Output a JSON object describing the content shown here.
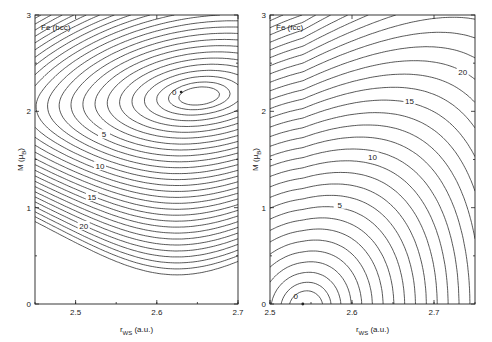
{
  "chart_data": [
    {
      "type": "contour",
      "title": "Fe (bcc)",
      "xlabel": "r_WS (a.u.)",
      "ylabel": "M (μ_B)",
      "xlim": [
        2.45,
        2.7
      ],
      "ylim": [
        0,
        3
      ],
      "xticks": [
        {
          "value": 2.5,
          "label": "2.5"
        },
        {
          "value": 2.6,
          "label": "2.6"
        },
        {
          "value": 2.7,
          "label": "2.7"
        }
      ],
      "yticks": [
        {
          "value": 0,
          "label": "0"
        },
        {
          "value": 1,
          "label": "1"
        },
        {
          "value": 2,
          "label": "2"
        },
        {
          "value": 3,
          "label": "3"
        }
      ],
      "minimum": {
        "r_ws": 2.63,
        "M": 2.2,
        "label": "0"
      },
      "contour_labels": [
        {
          "value": 5,
          "label": "5",
          "r_ws": 2.535,
          "M": 1.75
        },
        {
          "value": 10,
          "label": "10",
          "r_ws": 2.53,
          "M": 1.42
        },
        {
          "value": 15,
          "label": "15",
          "r_ws": 2.52,
          "M": 1.1
        },
        {
          "value": 20,
          "label": "20",
          "r_ws": 2.51,
          "M": 0.8
        }
      ],
      "contour_levels": 30,
      "grid": false
    },
    {
      "type": "contour",
      "title": "Fe (fcc)",
      "xlabel": "r_WS (a.u.)",
      "ylabel": "M (μ_B)",
      "xlim": [
        2.5,
        2.75
      ],
      "ylim": [
        0,
        3
      ],
      "xticks": [
        {
          "value": 2.5,
          "label": "2.5"
        },
        {
          "value": 2.6,
          "label": "2.6"
        },
        {
          "value": 2.7,
          "label": "2.7"
        }
      ],
      "yticks": [
        {
          "value": 0,
          "label": "0"
        },
        {
          "value": 1,
          "label": "1"
        },
        {
          "value": 2,
          "label": "2"
        },
        {
          "value": 3,
          "label": "3"
        }
      ],
      "minimum": {
        "r_ws": 2.54,
        "M": 0.0,
        "label": "0"
      },
      "contour_labels": [
        {
          "value": 5,
          "label": "5",
          "r_ws": 2.585,
          "M": 1.02
        },
        {
          "value": 10,
          "label": "10",
          "r_ws": 2.625,
          "M": 1.52
        },
        {
          "value": 15,
          "label": "15",
          "r_ws": 2.67,
          "M": 2.1
        },
        {
          "value": 20,
          "label": "20",
          "r_ws": 2.735,
          "M": 2.4
        }
      ],
      "contour_levels": 32,
      "grid": false
    }
  ]
}
